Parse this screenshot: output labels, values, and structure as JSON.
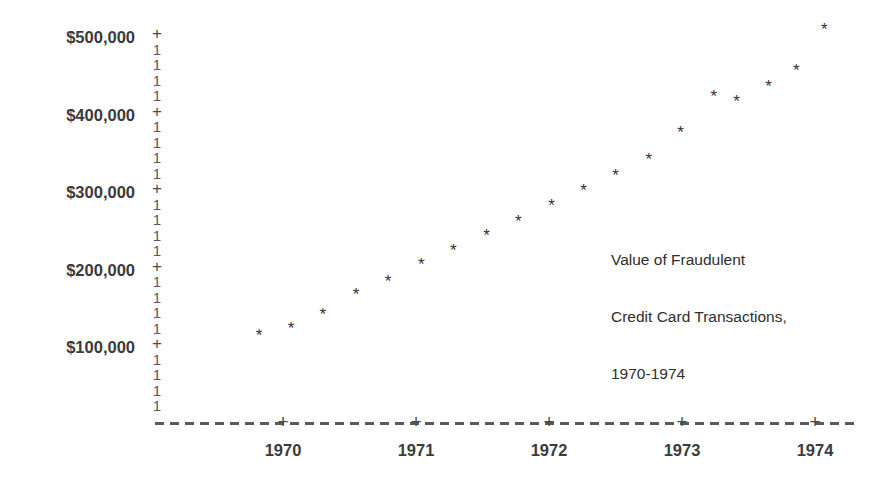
{
  "chart_data": {
    "type": "scatter",
    "title": "",
    "annotation": {
      "lines": [
        "Value of Fraudulent",
        "Credit Card Transactions,",
        "1970-1974"
      ]
    },
    "xlabel": "",
    "ylabel": "",
    "xlim": [
      1969.5,
      1974.3
    ],
    "ylim": [
      0,
      540000
    ],
    "grid": false,
    "legend": null,
    "y_ticks": [
      {
        "label": "$100,000",
        "value": 100000
      },
      {
        "label": "$200,000",
        "value": 200000
      },
      {
        "label": "$300,000",
        "value": 300000
      },
      {
        "label": "$400,000",
        "value": 400000
      },
      {
        "label": "$500,000",
        "value": 500000
      }
    ],
    "x_ticks": [
      {
        "label": "1970",
        "value": 1970
      },
      {
        "label": "1971",
        "value": 1971
      },
      {
        "label": "1972",
        "value": 1972
      },
      {
        "label": "1973",
        "value": 1973
      },
      {
        "label": "1974",
        "value": 1974
      }
    ],
    "marker_glyph": "*",
    "y_axis_major_glyph": "+",
    "y_axis_minor_glyph": "1",
    "y_axis_glyphs": [
      "+",
      "1",
      "1",
      "1",
      "1",
      "+",
      "1",
      "1",
      "1",
      "1",
      "+",
      "1",
      "1",
      "1",
      "1",
      "+",
      "1",
      "1",
      "1",
      "1",
      "+",
      "1",
      "1",
      "1",
      "1"
    ],
    "x": [
      1969.82,
      1970.06,
      1970.3,
      1970.55,
      1970.79,
      1971.04,
      1971.28,
      1971.53,
      1971.77,
      1972.02,
      1972.26,
      1972.5,
      1972.75,
      1972.99,
      1973.24,
      1973.41,
      1973.65,
      1973.86,
      1974.07
    ],
    "values": [
      115000,
      125000,
      143000,
      168000,
      185000,
      207000,
      225000,
      245000,
      263000,
      283000,
      302000,
      322000,
      343000,
      378000,
      424000,
      418000,
      437000,
      458000,
      510000
    ],
    "series": [
      {
        "name": "Value of Fraudulent Credit Card Transactions",
        "values": [
          115000,
          125000,
          143000,
          168000,
          185000,
          207000,
          225000,
          245000,
          263000,
          283000,
          302000,
          322000,
          343000,
          378000,
          424000,
          418000,
          437000,
          458000,
          510000
        ]
      }
    ]
  },
  "colors": {
    "background": "#ffffff",
    "axis": "#5a5a5a",
    "text": "#3b3b3b",
    "marker": "#333333"
  }
}
